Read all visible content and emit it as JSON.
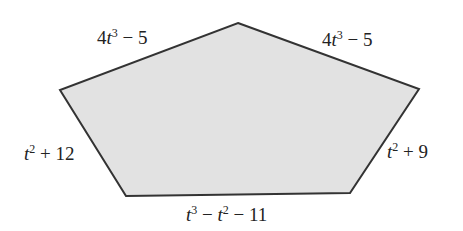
{
  "diagram": {
    "shape": "pentagon",
    "fill_color": "#e2e2e2",
    "stroke_color": "#333333",
    "vertices": [
      {
        "name": "top",
        "x": 238,
        "y": 23
      },
      {
        "name": "right",
        "x": 419,
        "y": 89
      },
      {
        "name": "bottom-right",
        "x": 350,
        "y": 193
      },
      {
        "name": "bottom-left",
        "x": 126,
        "y": 196
      },
      {
        "name": "left",
        "x": 60,
        "y": 90
      }
    ],
    "sides": [
      {
        "id": "top-left",
        "var": "t",
        "exp": "3",
        "coef": "4",
        "rest": " − 5",
        "text": "4t^3 − 5"
      },
      {
        "id": "top-right",
        "var": "t",
        "exp": "3",
        "coef": "4",
        "rest": " − 5",
        "text": "4t^3 − 5"
      },
      {
        "id": "right",
        "var": "t",
        "exp": "2",
        "coef": "",
        "rest": " + 9",
        "text": "t^2 + 9"
      },
      {
        "id": "bottom",
        "text": "t^3 − t^2 − 11",
        "part1_var": "t",
        "part1_exp": "3",
        "mid": " − ",
        "part2_var": "t",
        "part2_exp": "2",
        "rest": " − 11"
      },
      {
        "id": "left",
        "var": "t",
        "exp": "2",
        "coef": "",
        "rest": " + 12",
        "text": "t^2 + 12"
      }
    ]
  }
}
